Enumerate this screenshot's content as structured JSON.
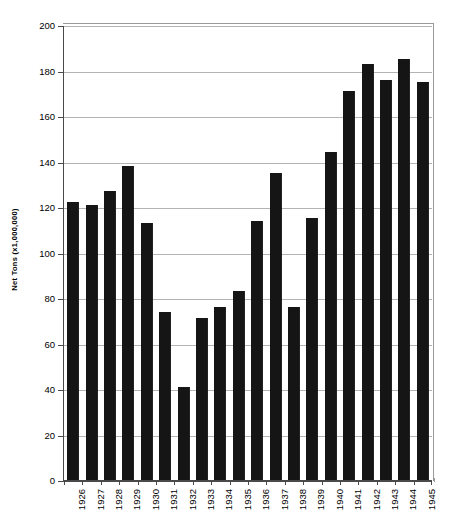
{
  "chart_data": {
    "type": "bar",
    "title": "",
    "xlabel": "",
    "ylabel": "Net Tons (x1,000,000)",
    "ylim": [
      0,
      200
    ],
    "ytick_step": 20,
    "yticks": [
      0,
      20,
      40,
      60,
      80,
      100,
      120,
      140,
      160,
      180,
      200
    ],
    "grid": true,
    "legend": null,
    "bar_color": "#151515",
    "categories": [
      "1926",
      "1927",
      "1928",
      "1929",
      "1930",
      "1931",
      "1932",
      "1933",
      "1934",
      "1935",
      "1936",
      "1937",
      "1938",
      "1939",
      "1940",
      "1941",
      "1942",
      "1943",
      "1944",
      "1945"
    ],
    "values": [
      122,
      121,
      127,
      138,
      113,
      74,
      41,
      71,
      76,
      83,
      114,
      135,
      76,
      115,
      144,
      171,
      183,
      176,
      185,
      175
    ]
  },
  "axes": {
    "y_title": "Net Tons (x1,000,000)"
  }
}
